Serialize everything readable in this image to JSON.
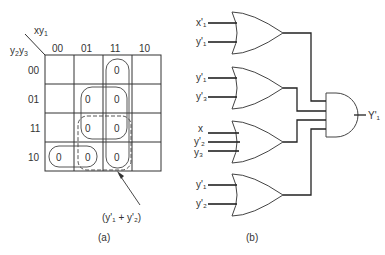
{
  "kmap": {
    "corner_top": "xy",
    "corner_top_sub": "1",
    "corner_left_a": "y",
    "corner_left_a_sub": "2",
    "corner_left_b": "y",
    "corner_left_b_sub": "3",
    "col_headers": [
      "00",
      "01",
      "11",
      "10"
    ],
    "row_headers": [
      "00",
      "01",
      "11",
      "10"
    ],
    "cells": [
      [
        "",
        "",
        "0",
        ""
      ],
      [
        "",
        "0",
        "0",
        ""
      ],
      [
        "",
        "0",
        "0",
        ""
      ],
      [
        "0",
        "0",
        "0",
        ""
      ]
    ],
    "annotation": "(y'₁ + y'₂)",
    "caption": "(a)"
  },
  "circuit": {
    "gates": [
      {
        "type": "OR",
        "inputs": [
          "x'₁",
          "y'₁"
        ]
      },
      {
        "type": "OR",
        "inputs": [
          "y'₁",
          "y'₃"
        ]
      },
      {
        "type": "OR",
        "inputs": [
          "x",
          "y'₂",
          "y₃"
        ]
      },
      {
        "type": "OR",
        "inputs": [
          "y'₁",
          "y'₂"
        ]
      }
    ],
    "and_gate": {
      "type": "AND",
      "output": "Y'₁"
    },
    "caption": "(b)"
  }
}
